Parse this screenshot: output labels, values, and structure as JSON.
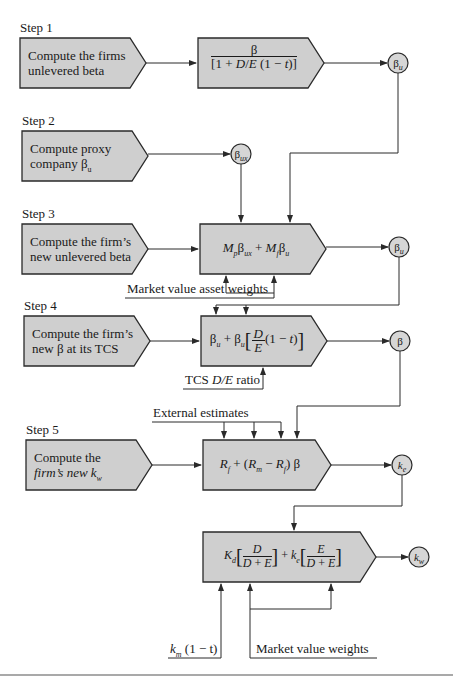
{
  "steps": [
    {
      "label": "Step 1",
      "description": [
        "Compute the firms",
        "unlevered beta"
      ]
    },
    {
      "label": "Step 2",
      "description": [
        "Compute proxy",
        "company β"
      ],
      "desc_sub": "u"
    },
    {
      "label": "Step 3",
      "description": [
        "Compute the firm’s",
        "new unlevered beta"
      ]
    },
    {
      "label": "Step 4",
      "description": [
        "Compute the firm’s",
        "new β at its TCS"
      ]
    },
    {
      "label": "Step 5",
      "description": [
        "Compute the",
        "firm’s new k"
      ],
      "desc_sub": "w"
    }
  ],
  "formulas": {
    "step1": {
      "numerator": "β",
      "denominator": "[1 + D/E (1 − t)]"
    },
    "step3": "M_p β_ux + M_f β_u",
    "step4": "β_u + β_u [D/E (1 − t)]",
    "step5": "R_f + (R_m − R_f) β",
    "wacc": "K_d [D / (D + E)] + k_e [E / (D + E)]"
  },
  "nodes": {
    "n1": {
      "base": "β",
      "sub": "u"
    },
    "n2": {
      "base": "β",
      "sub": "ux"
    },
    "n3": {
      "base": "β",
      "sub": "u"
    },
    "n4": {
      "base": "β",
      "sub": ""
    },
    "n5": {
      "base": "k",
      "sub": "e"
    },
    "n6": {
      "base": "k",
      "sub": "w"
    }
  },
  "notes": {
    "asset_weights": "Market value asset weights",
    "tcs_ratio_prefix": "TCS ",
    "tcs_ratio_italic": "D/E",
    "tcs_ratio_suffix": " ratio",
    "external": "External estimates",
    "market_weights": "Market value weights",
    "cost_of_debt_k": "k",
    "cost_of_debt_sub": "m",
    "cost_of_debt_rest": " (1 − t)"
  },
  "colors": {
    "box_fill": "#cfcfcf",
    "stroke": "#2a2a2a",
    "node_fill": "#d6d6d6"
  }
}
